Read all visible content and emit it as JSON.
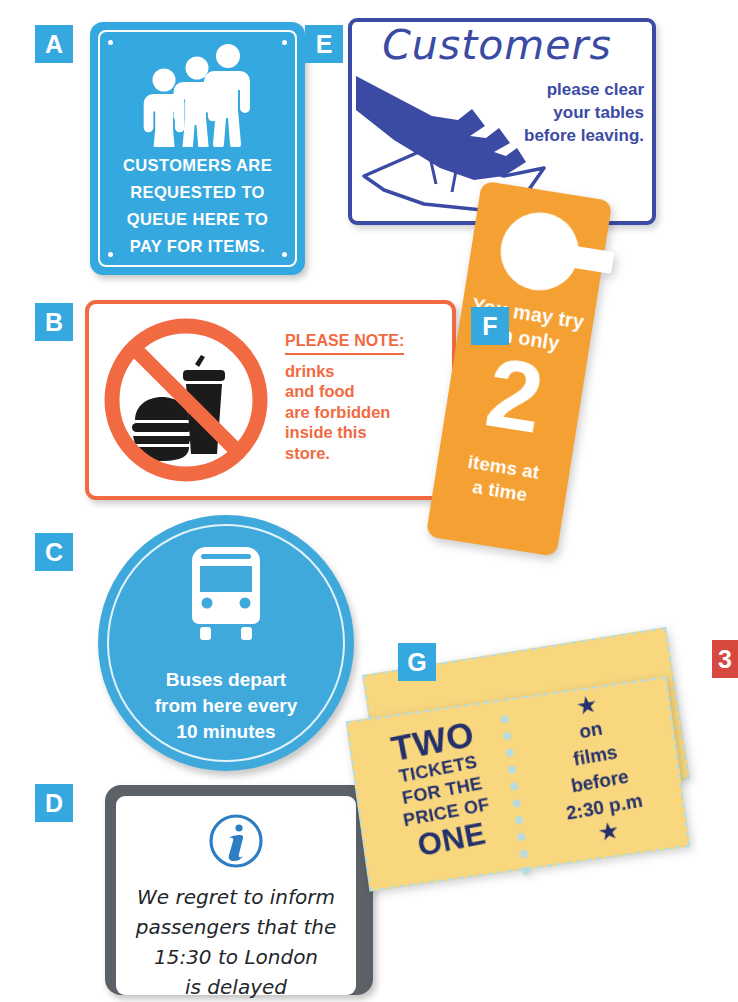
{
  "page": {
    "background_color": "#ffffff",
    "badge_color": "#35a8e0",
    "badge_red_color": "#d7483f"
  },
  "signs": [
    {
      "badge": "A",
      "name": "queue-sign",
      "type": "rectangular-blue-plate",
      "colors": {
        "background": "#35a8e0",
        "text": "#ffffff"
      },
      "icon": "three-people-queue-icon",
      "lines": [
        "CUSTOMERS ARE",
        "REQUESTED TO",
        "QUEUE HERE TO",
        "PAY FOR ITEMS."
      ]
    },
    {
      "badge": "B",
      "name": "no-food-drink-sign",
      "type": "rectangular-white-plate-orange-border",
      "colors": {
        "border": "#f26a42",
        "text": "#f26a42",
        "background": "#ffffff"
      },
      "icon": "no-food-or-drink-prohibition-icon",
      "heading": "PLEASE NOTE:",
      "lines": [
        "drinks",
        "and food",
        "are forbidden",
        "inside this",
        "store."
      ]
    },
    {
      "badge": "C",
      "name": "bus-departure-sign",
      "type": "circular-blue-sign",
      "colors": {
        "background": "#3fa9dc",
        "text": "#ffffff"
      },
      "icon": "bus-front-icon",
      "lines": [
        "Buses depart",
        "from here every",
        "10 minutes"
      ]
    },
    {
      "badge": "D",
      "name": "train-delay-notice",
      "type": "grey-framed-white-board",
      "colors": {
        "frame": "#5b6166",
        "background": "#ffffff",
        "text": "#23262b"
      },
      "icon": "information-i-icon",
      "lines": [
        "We regret to inform",
        "passengers that the",
        "15:30 to London",
        "is delayed"
      ]
    },
    {
      "badge": "E",
      "name": "clear-tables-sign",
      "type": "rectangular-white-plate-blue-border",
      "colors": {
        "border": "#3b4ba4",
        "text": "#3b4ba4",
        "background": "#ffffff"
      },
      "icon": "hand-wiping-table-icon",
      "title": "Customers",
      "lines": [
        "please clear",
        "your tables",
        "before leaving."
      ]
    },
    {
      "badge": "F",
      "name": "fitting-room-door-hanger",
      "type": "orange-door-hanger",
      "colors": {
        "background": "#f4a032",
        "text": "#ffffff"
      },
      "icon": "door-hanger-hole-icon",
      "top_lines": [
        "You may try",
        "on only"
      ],
      "number": "2",
      "bottom_lines": [
        "items at",
        "a time"
      ]
    },
    {
      "badge": "G",
      "name": "cinema-ticket-voucher",
      "type": "yellow-torn-ticket-pair",
      "colors": {
        "background": "#f8d77e",
        "text": "#24306b",
        "perforation": "#b8dbe0"
      },
      "icon": "star-icon",
      "left_lines": [
        "TWO",
        "TICKETS",
        "FOR THE",
        "PRICE OF",
        "ONE"
      ],
      "right_lines": [
        "on",
        "films",
        "before",
        "2:30 p.m"
      ],
      "star_glyph": "★"
    },
    {
      "badge": "3",
      "name": "cut-off-red-badge",
      "type": "partial-red-badge-right-edge",
      "colors": {
        "background": "#d7483f",
        "text": "#ffffff"
      }
    }
  ]
}
